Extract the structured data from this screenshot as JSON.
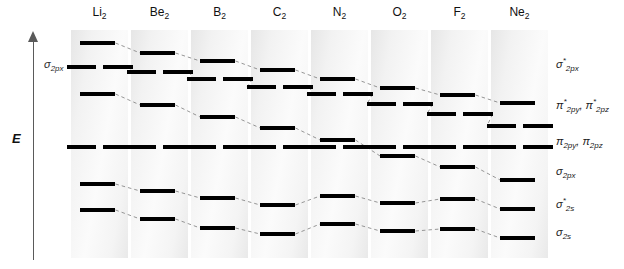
{
  "axis": {
    "energy_label": "E",
    "axis_note": "σ",
    "axis_note_sub": "2px",
    "direction": "up"
  },
  "columns": [
    {
      "name": "Li2",
      "symbol": "Li",
      "sub": "2",
      "x": 71
    },
    {
      "name": "Be2",
      "symbol": "Be",
      "sub": "2",
      "x": 131
    },
    {
      "name": "B2",
      "symbol": "B",
      "sub": "2",
      "x": 191
    },
    {
      "name": "C2",
      "symbol": "C",
      "sub": "2",
      "x": 251
    },
    {
      "name": "N2",
      "symbol": "N",
      "sub": "2",
      "x": 311
    },
    {
      "name": "O2",
      "symbol": "O",
      "sub": "2",
      "x": 371
    },
    {
      "name": "F2",
      "symbol": "F",
      "sub": "2",
      "x": 431
    },
    {
      "name": "Ne2",
      "symbol": "Ne",
      "sub": "2",
      "x": 491
    }
  ],
  "column_width": 57,
  "orbital_labels": [
    {
      "key": "sigma2px_star",
      "sigma": "σ",
      "sub": "2px",
      "star": "*",
      "y": 63
    },
    {
      "key": "pi2p_star",
      "sigma": "π",
      "sub": "2py",
      "star": "*",
      "y": 104,
      "second_sigma": "π",
      "second_sub": "2pz",
      "second_star": "*",
      "comma": ", "
    },
    {
      "key": "pi2p",
      "sigma": "π",
      "sub": "2py",
      "star": "",
      "y": 142,
      "second_sigma": "π",
      "second_sub": "2pz",
      "second_star": "",
      "comma": ", "
    },
    {
      "key": "sigma2px",
      "sigma": "σ",
      "sub": "2px",
      "star": "",
      "y": 172
    },
    {
      "key": "sigma2s_star",
      "sigma": "σ",
      "sub": "2s",
      "star": "*",
      "y": 203
    },
    {
      "key": "sigma2s",
      "sigma": "σ",
      "sub": "2s",
      "star": "",
      "y": 233
    }
  ],
  "chart_data": {
    "type": "line",
    "xlabel": "",
    "ylabel": "E",
    "categories": [
      "Li2",
      "Be2",
      "B2",
      "C2",
      "N2",
      "O2",
      "F2",
      "Ne2"
    ],
    "grid": false,
    "legend": "right-side orbital labels",
    "note": "y values are screen pixel centres of each drawn level bar (smaller y = higher energy)",
    "series": [
      {
        "name": "sigma*2px",
        "degenerate": false,
        "values": [
          43,
          53,
          61,
          70,
          79,
          88,
          95,
          103
        ]
      },
      {
        "name": "pi*2py, pi*2pz",
        "degenerate": true,
        "values": [
          62,
          67,
          75,
          83,
          91,
          100,
          110,
          126
        ]
      },
      {
        "name": "sigma2px_upper_branch",
        "degenerate": false,
        "values": [
          94,
          105,
          117,
          128,
          140,
          null,
          null,
          null
        ]
      },
      {
        "name": "pi2py, pi2pz",
        "degenerate": true,
        "values": [
          147,
          147,
          147,
          147,
          147,
          147,
          147,
          147
        ]
      },
      {
        "name": "sigma2px_lower_branch",
        "degenerate": false,
        "values": [
          null,
          null,
          null,
          null,
          null,
          153,
          166,
          180
        ]
      },
      {
        "name": "sigma*2s",
        "degenerate": false,
        "values": [
          192,
          199,
          205,
          212,
          218,
          225,
          131,
          208
        ]
      },
      {
        "name": "sigma2s",
        "degenerate": false,
        "values": [
          220,
          227,
          234,
          240,
          226,
          234,
          241,
          238
        ]
      }
    ]
  },
  "levels": [
    {
      "col": 0,
      "orbital": "sigma*2px",
      "y": 43,
      "wide": false
    },
    {
      "col": 0,
      "orbital": "pi*2p",
      "y": 67,
      "wide": true
    },
    {
      "col": 0,
      "orbital": "sigma2px",
      "y": 94,
      "wide": false
    },
    {
      "col": 0,
      "orbital": "pi2p",
      "y": 147,
      "wide": true
    },
    {
      "col": 0,
      "orbital": "sigma*2s",
      "y": 184,
      "wide": false
    },
    {
      "col": 0,
      "orbital": "sigma2s",
      "y": 210,
      "wide": false
    },
    {
      "col": 1,
      "orbital": "sigma*2px",
      "y": 53,
      "wide": false
    },
    {
      "col": 1,
      "orbital": "pi*2p",
      "y": 72,
      "wide": true
    },
    {
      "col": 1,
      "orbital": "sigma2px",
      "y": 105,
      "wide": false
    },
    {
      "col": 1,
      "orbital": "pi2p",
      "y": 147,
      "wide": true
    },
    {
      "col": 1,
      "orbital": "sigma*2s",
      "y": 191,
      "wide": false
    },
    {
      "col": 1,
      "orbital": "sigma2s",
      "y": 219,
      "wide": false
    },
    {
      "col": 2,
      "orbital": "sigma*2px",
      "y": 61,
      "wide": false
    },
    {
      "col": 2,
      "orbital": "pi*2p",
      "y": 79,
      "wide": true
    },
    {
      "col": 2,
      "orbital": "sigma2px",
      "y": 117,
      "wide": false
    },
    {
      "col": 2,
      "orbital": "pi2p",
      "y": 147,
      "wide": true
    },
    {
      "col": 2,
      "orbital": "sigma*2s",
      "y": 198,
      "wide": false
    },
    {
      "col": 2,
      "orbital": "sigma2s",
      "y": 228,
      "wide": false
    },
    {
      "col": 3,
      "orbital": "sigma*2px",
      "y": 70,
      "wide": false
    },
    {
      "col": 3,
      "orbital": "pi*2p",
      "y": 87,
      "wide": true
    },
    {
      "col": 3,
      "orbital": "sigma2px",
      "y": 128,
      "wide": false
    },
    {
      "col": 3,
      "orbital": "pi2p",
      "y": 147,
      "wide": true
    },
    {
      "col": 3,
      "orbital": "sigma*2s",
      "y": 205,
      "wide": false
    },
    {
      "col": 3,
      "orbital": "sigma2s",
      "y": 234,
      "wide": false
    },
    {
      "col": 4,
      "orbital": "sigma*2px",
      "y": 79,
      "wide": false
    },
    {
      "col": 4,
      "orbital": "pi*2p",
      "y": 94,
      "wide": true
    },
    {
      "col": 4,
      "orbital": "sigma2px",
      "y": 140,
      "wide": false
    },
    {
      "col": 4,
      "orbital": "pi2p",
      "y": 147,
      "wide": true
    },
    {
      "col": 4,
      "orbital": "sigma*2s",
      "y": 196,
      "wide": false
    },
    {
      "col": 4,
      "orbital": "sigma2s",
      "y": 224,
      "wide": false
    },
    {
      "col": 5,
      "orbital": "sigma*2px",
      "y": 88,
      "wide": false
    },
    {
      "col": 5,
      "orbital": "pi*2p",
      "y": 104,
      "wide": true
    },
    {
      "col": 5,
      "orbital": "pi2p",
      "y": 147,
      "wide": true
    },
    {
      "col": 5,
      "orbital": "sigma2px",
      "y": 156,
      "wide": false
    },
    {
      "col": 5,
      "orbital": "sigma*2s",
      "y": 203,
      "wide": false
    },
    {
      "col": 5,
      "orbital": "sigma2s",
      "y": 231,
      "wide": false
    },
    {
      "col": 6,
      "orbital": "sigma*2px",
      "y": 95,
      "wide": false
    },
    {
      "col": 6,
      "orbital": "pi*2p",
      "y": 114,
      "wide": true
    },
    {
      "col": 6,
      "orbital": "pi2p",
      "y": 147,
      "wide": true
    },
    {
      "col": 6,
      "orbital": "sigma2px",
      "y": 167,
      "wide": false
    },
    {
      "col": 6,
      "orbital": "sigma*2s",
      "y": 199,
      "wide": false
    },
    {
      "col": 6,
      "orbital": "sigma2s",
      "y": 229,
      "wide": false
    },
    {
      "col": 7,
      "orbital": "sigma*2px",
      "y": 103,
      "wide": false
    },
    {
      "col": 7,
      "orbital": "pi*2p",
      "y": 126,
      "wide": true
    },
    {
      "col": 7,
      "orbital": "pi2p",
      "y": 147,
      "wide": true
    },
    {
      "col": 7,
      "orbital": "sigma2px",
      "y": 180,
      "wide": false
    },
    {
      "col": 7,
      "orbital": "sigma*2s",
      "y": 209,
      "wide": false
    },
    {
      "col": 7,
      "orbital": "sigma2s",
      "y": 238,
      "wide": false
    }
  ]
}
